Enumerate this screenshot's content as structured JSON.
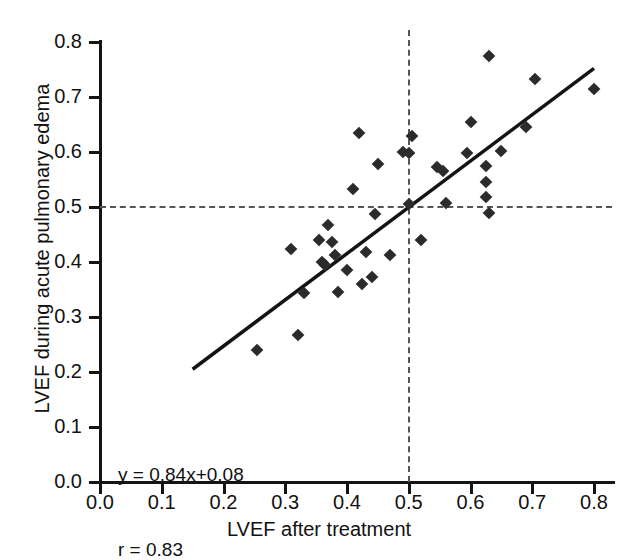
{
  "chart_data": {
    "type": "scatter",
    "title": "",
    "xlabel": "LVEF after treatment",
    "ylabel": "LVEF during acute pulmonary edema",
    "xlim": [
      0.0,
      0.8
    ],
    "ylim": [
      0.0,
      0.8
    ],
    "xticks": [
      "0.0",
      "0.1",
      "0.2",
      "0.3",
      "0.4",
      "0.5",
      "0.6",
      "0.7",
      "0.8"
    ],
    "yticks": [
      "0.0",
      "0.1",
      "0.2",
      "0.3",
      "0.4",
      "0.5",
      "0.6",
      "0.7",
      "0.8"
    ],
    "grid": false,
    "legend": null,
    "marker": "diamond",
    "marker_color": "#2b2b2b",
    "annotations": [
      "y = 0.84x+0.08",
      "r = 0.83"
    ],
    "regression": {
      "equation": "y = 0.84x+0.08",
      "slope": 0.84,
      "intercept": 0.08,
      "r": 0.83,
      "x_start": 0.15,
      "y_start": 0.205,
      "x_end": 0.8,
      "y_end": 0.752
    },
    "reference_lines": [
      {
        "orientation": "horizontal",
        "value": 0.5,
        "style": "dashed"
      },
      {
        "orientation": "vertical",
        "value": 0.5,
        "style": "dashed"
      }
    ],
    "points": [
      {
        "x": 0.255,
        "y": 0.24
      },
      {
        "x": 0.32,
        "y": 0.267
      },
      {
        "x": 0.31,
        "y": 0.424
      },
      {
        "x": 0.33,
        "y": 0.343
      },
      {
        "x": 0.355,
        "y": 0.44
      },
      {
        "x": 0.36,
        "y": 0.4
      },
      {
        "x": 0.365,
        "y": 0.395
      },
      {
        "x": 0.37,
        "y": 0.468
      },
      {
        "x": 0.375,
        "y": 0.436
      },
      {
        "x": 0.38,
        "y": 0.412
      },
      {
        "x": 0.385,
        "y": 0.345
      },
      {
        "x": 0.4,
        "y": 0.385
      },
      {
        "x": 0.41,
        "y": 0.533
      },
      {
        "x": 0.42,
        "y": 0.635
      },
      {
        "x": 0.425,
        "y": 0.36
      },
      {
        "x": 0.43,
        "y": 0.418
      },
      {
        "x": 0.44,
        "y": 0.372
      },
      {
        "x": 0.445,
        "y": 0.488
      },
      {
        "x": 0.45,
        "y": 0.578
      },
      {
        "x": 0.47,
        "y": 0.412
      },
      {
        "x": 0.49,
        "y": 0.6
      },
      {
        "x": 0.5,
        "y": 0.598
      },
      {
        "x": 0.5,
        "y": 0.505
      },
      {
        "x": 0.505,
        "y": 0.63
      },
      {
        "x": 0.52,
        "y": 0.44
      },
      {
        "x": 0.545,
        "y": 0.572
      },
      {
        "x": 0.555,
        "y": 0.565
      },
      {
        "x": 0.56,
        "y": 0.508
      },
      {
        "x": 0.595,
        "y": 0.598
      },
      {
        "x": 0.6,
        "y": 0.655
      },
      {
        "x": 0.625,
        "y": 0.575
      },
      {
        "x": 0.625,
        "y": 0.545
      },
      {
        "x": 0.625,
        "y": 0.518
      },
      {
        "x": 0.63,
        "y": 0.49
      },
      {
        "x": 0.63,
        "y": 0.775
      },
      {
        "x": 0.65,
        "y": 0.602
      },
      {
        "x": 0.69,
        "y": 0.645
      },
      {
        "x": 0.705,
        "y": 0.733
      },
      {
        "x": 0.8,
        "y": 0.715
      }
    ]
  }
}
